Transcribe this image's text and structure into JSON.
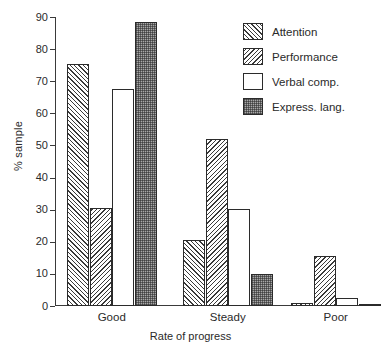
{
  "chart_data": {
    "type": "bar",
    "title": "",
    "subtitle": "",
    "xlabel": "Rate of progress",
    "ylabel": "% sample",
    "categories": [
      "Good",
      "Steady",
      "Poor"
    ],
    "series": [
      {
        "name": "Attention",
        "values": [
          75.5,
          20.5,
          1.0
        ],
        "fill": "hatch-forward-diagonal",
        "color": "#3a3a3a"
      },
      {
        "name": "Performance",
        "values": [
          30.5,
          52.0,
          15.5
        ],
        "fill": "hatch-backward-diagonal",
        "color": "#3a3a3a"
      },
      {
        "name": "Verbal comp.",
        "values": [
          67.5,
          30.3,
          2.5
        ],
        "fill": "empty-white",
        "color": "#ffffff"
      },
      {
        "name": "Express. lang.",
        "values": [
          88.5,
          10.0,
          0.5
        ],
        "fill": "stipple-gray",
        "color": "#a8a8a8"
      }
    ],
    "ylim": [
      0,
      90
    ],
    "yticks": [
      0,
      10,
      20,
      30,
      40,
      50,
      60,
      70,
      80,
      90
    ],
    "ytick_labels": [
      "0",
      "10",
      "20",
      "30",
      "40",
      "50",
      "60",
      "70",
      "80",
      "90"
    ],
    "grid": false,
    "legend_position": "top-right",
    "annotations": []
  },
  "legend": {
    "entries": [
      {
        "label": "Attention"
      },
      {
        "label": "Performance"
      },
      {
        "label": "Verbal comp."
      },
      {
        "label": "Express. lang."
      }
    ]
  }
}
